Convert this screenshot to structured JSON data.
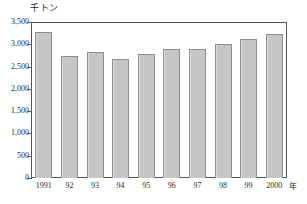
{
  "chart_data": {
    "type": "bar",
    "title": "",
    "subtitle": "",
    "xlabel": "年",
    "ylabel": "千トン",
    "categories": [
      "1991",
      "92",
      "93",
      "94",
      "95",
      "96",
      "97",
      "98",
      "99",
      "2000"
    ],
    "values": [
      3270,
      2730,
      2820,
      2670,
      2790,
      2900,
      2900,
      3000,
      3130,
      3220
    ],
    "ylim": [
      0,
      3500
    ],
    "yticks": [
      0,
      500,
      1000,
      1500,
      2000,
      2500,
      3000,
      3500
    ],
    "ytick_labels": [
      "0",
      "500",
      "1,000",
      "1,500",
      "2,000",
      "2,500",
      "3,000",
      "3,500"
    ],
    "grid": false,
    "legend": null,
    "series": [
      {
        "name": "",
        "values": [
          3270,
          2730,
          2820,
          2670,
          2790,
          2900,
          2900,
          3000,
          3130,
          3220
        ]
      }
    ],
    "bar_color": "#c6c6c6",
    "bar_border_color": "#8d8d8d",
    "axis_color": "#555555",
    "text_color": "#2a2a2a",
    "background": "#ffffff"
  }
}
